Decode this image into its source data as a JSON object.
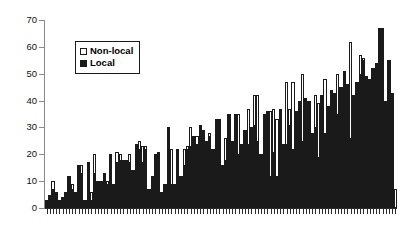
{
  "chart_data": {
    "type": "bar",
    "title": "",
    "subtitle": "",
    "xlabel": "",
    "ylabel": "",
    "ylim": [
      0,
      70
    ],
    "yticks": [
      0,
      10,
      20,
      30,
      40,
      50,
      60,
      70
    ],
    "grid": false,
    "legend_position": "upper-left-inside",
    "legend": [
      "Non-local",
      "Local"
    ],
    "colors": {
      "nonlocal_fill": "#ffffff",
      "nonlocal_edge": "#1a1a1a",
      "local_fill": "#1a1a1a",
      "axis": "#8a8a8a",
      "text": "#000000"
    },
    "n_categories": 110,
    "categories": [
      "1",
      "2",
      "3",
      "4",
      "5",
      "6",
      "7",
      "8",
      "9",
      "10",
      "11",
      "12",
      "13",
      "14",
      "15",
      "16",
      "17",
      "18",
      "19",
      "20",
      "21",
      "22",
      "23",
      "24",
      "25",
      "26",
      "27",
      "28",
      "29",
      "30",
      "31",
      "32",
      "33",
      "34",
      "35",
      "36",
      "37",
      "38",
      "39",
      "40",
      "41",
      "42",
      "43",
      "44",
      "45",
      "46",
      "47",
      "48",
      "49",
      "50",
      "51",
      "52",
      "53",
      "54",
      "55",
      "56",
      "57",
      "58",
      "59",
      "60",
      "61",
      "62",
      "63",
      "64",
      "65",
      "66",
      "67",
      "68",
      "69",
      "70",
      "71",
      "72",
      "73",
      "74",
      "75",
      "76",
      "77",
      "78",
      "79",
      "80",
      "81",
      "82",
      "83",
      "84",
      "85",
      "86",
      "87",
      "88",
      "89",
      "90",
      "91",
      "92",
      "93",
      "94",
      "95",
      "96",
      "97",
      "98",
      "99",
      "100",
      "101",
      "102",
      "103",
      "104",
      "105",
      "106",
      "107",
      "108",
      "109",
      "110"
    ],
    "series": [
      {
        "name": "Non-local",
        "values": [
          3,
          5,
          10,
          6,
          3,
          4,
          6,
          12,
          9,
          6,
          16,
          16,
          3,
          17,
          6,
          20,
          10,
          10,
          13,
          10,
          20,
          9,
          21,
          20,
          18,
          18,
          20,
          14,
          24,
          25,
          23,
          23,
          7,
          12,
          20,
          21,
          6,
          9,
          30,
          22,
          9,
          22,
          12,
          22,
          23,
          30,
          27,
          27,
          31,
          29,
          25,
          28,
          22,
          33,
          33,
          16,
          26,
          35,
          25,
          35,
          35,
          24,
          29,
          37,
          30,
          42,
          42,
          20,
          35,
          36,
          36,
          37,
          33,
          37,
          24,
          47,
          37,
          47,
          36,
          40,
          50,
          41,
          40,
          28,
          42,
          39,
          42,
          48,
          38,
          44,
          43,
          50,
          45,
          51,
          46,
          62,
          42,
          47,
          57,
          56,
          49,
          48,
          52,
          54,
          67,
          67,
          40,
          55,
          43,
          7
        ]
      },
      {
        "name": "Local",
        "values": [
          3,
          5,
          7,
          6,
          3,
          4,
          6,
          12,
          7,
          6,
          16,
          13,
          3,
          17,
          3,
          13,
          10,
          10,
          13,
          9,
          20,
          9,
          17,
          18,
          18,
          18,
          17,
          14,
          24,
          22,
          17,
          22,
          7,
          12,
          20,
          21,
          6,
          9,
          30,
          9,
          9,
          22,
          12,
          16,
          22,
          23,
          27,
          24,
          31,
          29,
          25,
          27,
          22,
          33,
          33,
          16,
          18,
          35,
          25,
          35,
          20,
          24,
          29,
          24,
          30,
          31,
          25,
          20,
          35,
          36,
          12,
          21,
          12,
          37,
          24,
          24,
          31,
          22,
          36,
          40,
          25,
          41,
          40,
          28,
          30,
          19,
          42,
          28,
          38,
          44,
          43,
          35,
          45,
          51,
          46,
          26,
          42,
          47,
          50,
          55,
          49,
          48,
          52,
          54,
          67,
          67,
          40,
          55,
          43,
          0
        ]
      }
    ]
  }
}
